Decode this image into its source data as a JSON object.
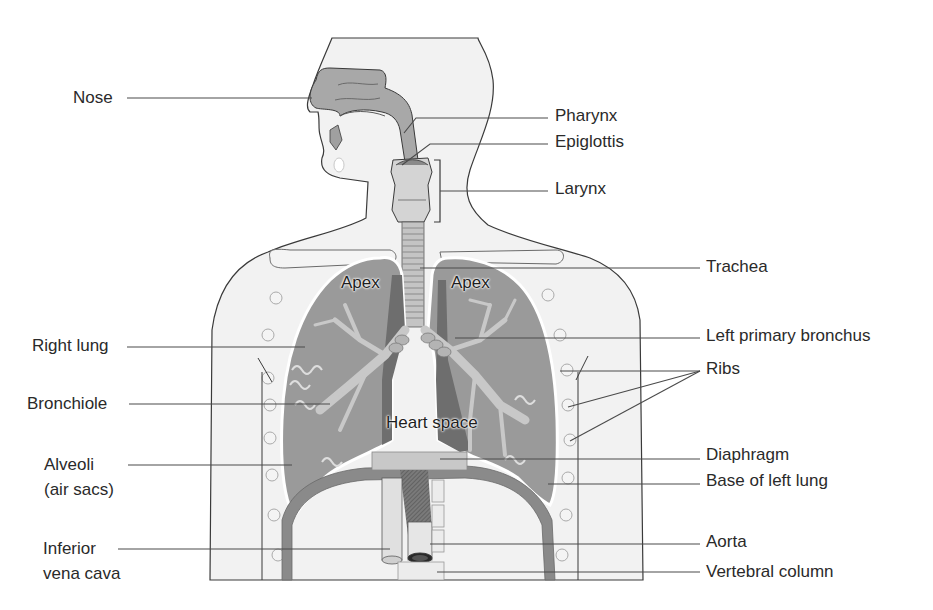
{
  "colors": {
    "background": "#ffffff",
    "body_fill": "#f2f2f2",
    "outline": "#3a3a3a",
    "lung_fill": "#9a9a9a",
    "lung_dark": "#6e6e6e",
    "airway_fill": "#c4c4c4",
    "leader_line": "#4a4a4a",
    "label_text": "#2a2a2a"
  },
  "labels_left": [
    {
      "id": "nose",
      "text": "Nose",
      "x": 73,
      "y": 88,
      "line": [
        127,
        98,
        312,
        98
      ]
    },
    {
      "id": "right-lung",
      "text": "Right lung",
      "x": 32,
      "y": 336,
      "line": [
        127,
        347,
        305,
        347
      ]
    },
    {
      "id": "bronchiole",
      "text": "Bronchiole",
      "x": 27,
      "y": 394,
      "line": [
        129,
        404,
        330,
        404
      ]
    },
    {
      "id": "alveoli",
      "text": "Alveoli",
      "x": 44,
      "y": 455,
      "line": [
        128,
        465,
        292,
        465
      ]
    },
    {
      "id": "alveoli-sub",
      "text": "(air sacs)",
      "x": 44,
      "y": 480,
      "line": null
    },
    {
      "id": "inferior-vena-cava",
      "text": "Inferior",
      "x": 43,
      "y": 539,
      "line": [
        118,
        549,
        390,
        549
      ]
    },
    {
      "id": "inferior-vena-cava-sub",
      "text": "vena cava",
      "x": 43,
      "y": 564,
      "line": null
    }
  ],
  "labels_right": [
    {
      "id": "pharynx",
      "text": "Pharynx",
      "x": 555,
      "y": 106,
      "line": [
        548,
        118,
        416,
        118,
        404,
        133
      ]
    },
    {
      "id": "epiglottis",
      "text": "Epiglottis",
      "x": 555,
      "y": 132,
      "line": [
        548,
        144,
        430,
        144,
        402,
        165
      ]
    },
    {
      "id": "larynx",
      "text": "Larynx",
      "x": 555,
      "y": 179,
      "line": [
        548,
        191,
        440,
        191
      ]
    },
    {
      "id": "trachea",
      "text": "Trachea",
      "x": 706,
      "y": 257,
      "line": [
        700,
        268,
        420,
        268
      ]
    },
    {
      "id": "left-primary-bronchus",
      "text": "Left primary bronchus",
      "x": 706,
      "y": 326,
      "line": [
        700,
        338,
        455,
        338
      ]
    },
    {
      "id": "ribs",
      "text": "Ribs",
      "x": 706,
      "y": 359,
      "line": null
    },
    {
      "id": "diaphragm",
      "text": "Diaphragm",
      "x": 706,
      "y": 445,
      "line": [
        700,
        459,
        440,
        459
      ]
    },
    {
      "id": "base-of-left-lung",
      "text": "Base of left lung",
      "x": 706,
      "y": 471,
      "line": [
        700,
        484,
        548,
        484
      ]
    },
    {
      "id": "aorta",
      "text": "Aorta",
      "x": 706,
      "y": 532,
      "line": [
        700,
        544,
        430,
        544
      ]
    },
    {
      "id": "vertebral-column",
      "text": "Vertebral column",
      "x": 706,
      "y": 562,
      "line": [
        700,
        572,
        437,
        572
      ]
    }
  ],
  "ribs_pointers": [
    [
      700,
      371,
      560,
      371
    ],
    [
      700,
      371,
      568,
      407
    ],
    [
      700,
      371,
      570,
      441
    ]
  ],
  "larynx_bracket": {
    "x": 440,
    "y1": 160,
    "y2": 222
  },
  "inner_labels": [
    {
      "id": "apex-right",
      "text": "Apex",
      "x": 341,
      "y": 273
    },
    {
      "id": "apex-left",
      "text": "Apex",
      "x": 451,
      "y": 273
    },
    {
      "id": "heart-space",
      "text": "Heart space",
      "x": 386,
      "y": 413
    }
  ]
}
